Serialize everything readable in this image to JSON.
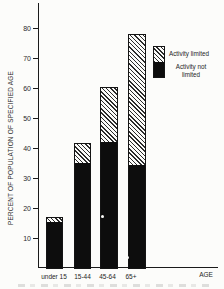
{
  "figure": {
    "y_axis_title": "PERCENT OF POPULATION OF SPECIFIED AGE",
    "x_axis_title": "AGE"
  },
  "legend": {
    "limited_label": "Activity limited",
    "not_limited_label": "Activity not limited"
  },
  "colors": {
    "ink": "#141414",
    "bar_solid": "#0d0d0d",
    "paper": "#fcfcfa"
  },
  "chart_data": {
    "type": "bar",
    "stacked": true,
    "title": "",
    "categories": [
      "under 15",
      "15-44",
      "45-64",
      "65+"
    ],
    "series": [
      {
        "name": "Activity not limited",
        "style": "solid-black",
        "values": [
          15.3,
          35.0,
          42.0,
          34.5
        ]
      },
      {
        "name": "Activity limited",
        "style": "diagonal-hatch",
        "values": [
          1.7,
          6.7,
          18.5,
          43.5
        ]
      }
    ],
    "stack_totals": [
      17.0,
      41.7,
      60.5,
      78.0
    ],
    "xlabel": "AGE",
    "ylabel": "PERCENT OF POPULATION OF SPECIFIED AGE",
    "ylim": [
      0,
      80
    ],
    "y_ticks": [
      10,
      20,
      30,
      40,
      50,
      60,
      70,
      80
    ],
    "grid": false,
    "legend_position": "upper-right"
  }
}
